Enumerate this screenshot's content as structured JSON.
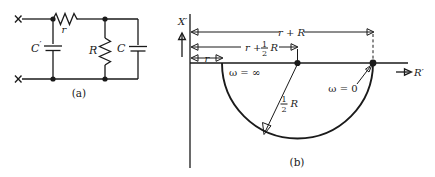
{
  "figure": {
    "background_color": "#ffffff",
    "ink_color": "#1a1a1a",
    "panels": [
      {
        "id": "a",
        "caption": "(a)",
        "type": "circuit-schematic",
        "description": "Two-terminal RC network: shunt capacitor C-prime, series resistor r, then parallel R and C.",
        "terminals": [
          {
            "name": "terminal-top",
            "marker": "×"
          },
          {
            "name": "terminal-bottom",
            "marker": "×"
          }
        ],
        "components": [
          {
            "name": "capacitor-c-prime",
            "label": "C",
            "prime": "′",
            "orientation": "vertical",
            "symbol": "capacitor"
          },
          {
            "name": "resistor-r-lower",
            "label": "r",
            "orientation": "horizontal",
            "symbol": "resistor-zigzag"
          },
          {
            "name": "resistor-R",
            "label": "R",
            "orientation": "vertical",
            "symbol": "resistor-zigzag"
          },
          {
            "name": "capacitor-C",
            "label": "C",
            "orientation": "vertical",
            "symbol": "capacitor"
          }
        ],
        "node_count": 4
      },
      {
        "id": "b",
        "caption": "(b)",
        "type": "impedance-locus-semicircle",
        "axes": {
          "vertical_label": "X′",
          "vertical_label_plain": "X'",
          "horizontal_label": "R′",
          "horizontal_label_plain": "R'",
          "vertical_arrow": "up",
          "horizontal_arrow": "right"
        },
        "dimensions": [
          {
            "name": "dim-r-plus-R",
            "label": "r + R",
            "row": 1
          },
          {
            "name": "dim-r-plus-half-R",
            "label": "r + ½R",
            "label_parts": {
              "lead": "r +",
              "num": "1",
              "den": "2",
              "tail": "R"
            },
            "row": 2
          },
          {
            "name": "dim-r",
            "label": "r",
            "row": 3
          }
        ],
        "radius_label": {
          "num": "1",
          "den": "2",
          "tail": "R",
          "plain": "½R"
        },
        "markers": [
          {
            "name": "omega-infinity-point",
            "label": "ω = ∞",
            "position": "left-end-of-semicircle"
          },
          {
            "name": "center-point",
            "label": "",
            "position": "center-of-semicircle"
          },
          {
            "name": "omega-zero-point",
            "label": "ω = 0",
            "position": "right-end-of-semicircle"
          }
        ],
        "curve": {
          "shape": "lower-semicircle",
          "center_x_meaning": "r + ½R",
          "radius_meaning": "½R",
          "left_end_meaning": "r",
          "right_end_meaning": "r + R"
        }
      }
    ]
  }
}
